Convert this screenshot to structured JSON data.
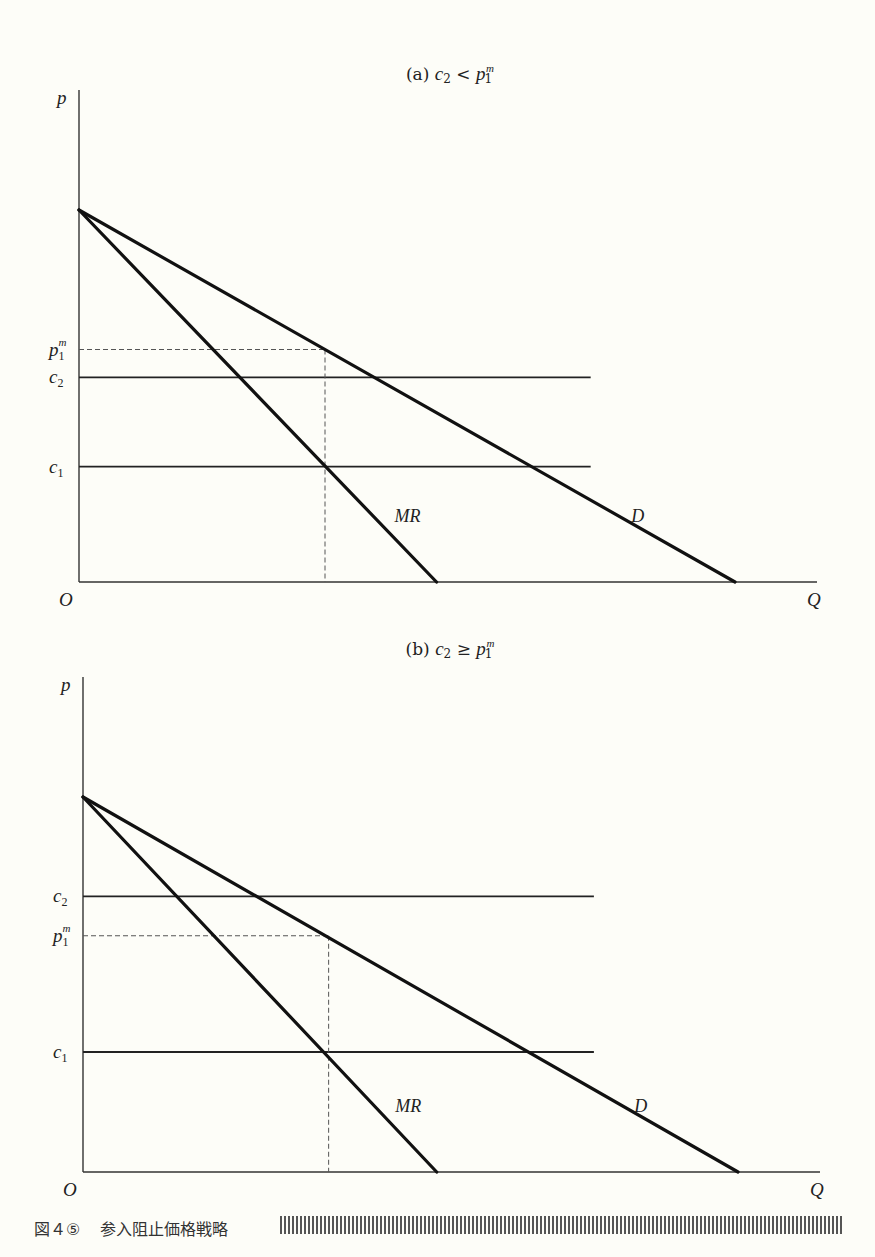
{
  "figure": {
    "caption_number": "図４⑤",
    "caption_title": "参入阻止価格戦略"
  },
  "chart_data": [
    {
      "type": "line",
      "panel": "a",
      "title": "(a)  c₂ < p₁ᵐ",
      "title_parts": {
        "prefix": "(a)",
        "lhs": "c",
        "lhs_sub": "2",
        "op": "<",
        "rhs": "p",
        "rhs_sub": "1",
        "rhs_sup": "m"
      },
      "xlabel": "Q",
      "ylabel": "p",
      "origin_label": "O",
      "xlim": [
        0,
        12.4
      ],
      "ylim": [
        0,
        10.2
      ],
      "grid": false,
      "series": [
        {
          "name": "D",
          "label": "D",
          "points": [
            [
              0,
              10
            ],
            [
              10,
              0
            ]
          ],
          "style": "thick"
        },
        {
          "name": "MR",
          "label": "MR",
          "points": [
            [
              0,
              10
            ],
            [
              5.45,
              0
            ]
          ],
          "style": "thick"
        }
      ],
      "hlines": [
        {
          "name": "c2",
          "label": "c",
          "sub": "2",
          "y": 5.5,
          "x_end": 7.8,
          "style": "solid"
        },
        {
          "name": "c1",
          "label": "c",
          "sub": "1",
          "y": 3.1,
          "x_end": 7.8,
          "style": "solid"
        },
        {
          "name": "p1m",
          "label": "p",
          "sub": "1",
          "sup": "m",
          "y": 6.25,
          "x_end": 3.75,
          "style": "dashed"
        }
      ],
      "vlines": [
        {
          "name": "q1m",
          "x": 3.75,
          "y_end": 6.25,
          "style": "dashed"
        }
      ]
    },
    {
      "type": "line",
      "panel": "b",
      "title": "(b)  c₂ ≥ p₁ᵐ",
      "title_parts": {
        "prefix": "(b)",
        "lhs": "c",
        "lhs_sub": "2",
        "op": "≥",
        "rhs": "p",
        "rhs_sub": "1",
        "rhs_sup": "m"
      },
      "xlabel": "Q",
      "ylabel": "p",
      "origin_label": "O",
      "xlim": [
        0,
        12.4
      ],
      "ylim": [
        0,
        13.2
      ],
      "grid": false,
      "series": [
        {
          "name": "D",
          "label": "D",
          "points": [
            [
              0,
              10
            ],
            [
              10,
              0
            ]
          ],
          "style": "thick"
        },
        {
          "name": "MR",
          "label": "MR",
          "points": [
            [
              0,
              10
            ],
            [
              5.4,
              0
            ]
          ],
          "style": "thick"
        }
      ],
      "hlines": [
        {
          "name": "c2",
          "label": "c",
          "sub": "2",
          "y": 7.35,
          "x_end": 7.8,
          "style": "solid"
        },
        {
          "name": "p1m",
          "label": "p",
          "sub": "1",
          "sup": "m",
          "y": 6.3,
          "x_end": 3.75,
          "style": "dashed"
        },
        {
          "name": "c1",
          "label": "c",
          "sub": "1",
          "y": 3.2,
          "x_end": 7.8,
          "style": "solid"
        }
      ],
      "vlines": [
        {
          "name": "q1m",
          "x": 3.75,
          "y_end": 6.3,
          "style": "dashed"
        }
      ]
    }
  ]
}
